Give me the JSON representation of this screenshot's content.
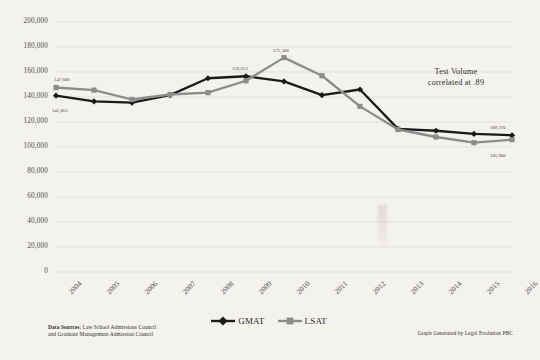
{
  "chart_data": {
    "type": "line",
    "title": "",
    "xlabel": "",
    "ylabel": "",
    "x": [
      "2004",
      "2005",
      "2006",
      "2007",
      "2008",
      "2009",
      "2010",
      "2011",
      "2012",
      "2013",
      "2014",
      "2015",
      "2016"
    ],
    "categories": [
      "2004",
      "2005",
      "2006",
      "2007",
      "2008",
      "2009",
      "2010",
      "2011",
      "2012",
      "2013",
      "2014",
      "2015",
      "2016"
    ],
    "ylim": [
      0,
      200000
    ],
    "xlim": [
      2004,
      2016
    ],
    "yticks": [
      "0",
      "20,000",
      "40,000",
      "60,000",
      "80,000",
      "100,000",
      "120,000",
      "140,000",
      "160,000",
      "180,000",
      "200,000"
    ],
    "ytick_values": [
      0,
      20000,
      40000,
      60000,
      80000,
      100000,
      120000,
      140000,
      160000,
      180000,
      200000
    ],
    "grid": true,
    "legend_position": "bottom-center",
    "series": [
      {
        "name": "GMAT",
        "color": "#1a1a1a",
        "marker": "diamond",
        "values": [
          141063,
          136500,
          135500,
          141500,
          155000,
          156613,
          152500,
          141500,
          146000,
          114500,
          113000,
          110500,
          109370
        ]
      },
      {
        "name": "LSAT",
        "color": "#8c8c8c",
        "marker": "square",
        "values": [
          147600,
          145500,
          138000,
          142000,
          143500,
          153000,
          171500,
          157000,
          132500,
          114000,
          108000,
          103500,
          105900
        ]
      }
    ],
    "point_labels": [
      {
        "series": "LSAT",
        "x": "2004",
        "text": "147,600",
        "dx": -2,
        "dy": -11
      },
      {
        "series": "GMAT",
        "x": "2004",
        "text": "141,063",
        "dx": -4,
        "dy": 12
      },
      {
        "series": "GMAT",
        "x": "2009",
        "text": "156,613",
        "dx": -14,
        "dy": -10
      },
      {
        "series": "LSAT",
        "x": "2010",
        "text": "171,500",
        "dx": -11,
        "dy": -10
      },
      {
        "series": "GMAT",
        "x": "2016",
        "text": "109,370",
        "dx": -22,
        "dy": -10
      },
      {
        "series": "LSAT",
        "x": "2016",
        "text": "105,900",
        "dx": -22,
        "dy": 13
      }
    ],
    "annotations": [
      {
        "name": "correlation-note",
        "line1": "Test Volume",
        "line2": "correlated at .89"
      }
    ]
  },
  "legend": {
    "items": [
      {
        "label": "GMAT",
        "color": "#1a1a1a",
        "marker": "diamond"
      },
      {
        "label": "LSAT",
        "color": "#8c8c8c",
        "marker": "square"
      }
    ]
  },
  "footer": {
    "sources_bold": "Data Sources",
    "sources_line1_rest": ": Law School Admissions Council",
    "sources_line2": "and Graduate Management Admission Council",
    "generated_by": "Graph Generated by Legal Evolution PBC"
  },
  "colors": {
    "background": "#f4f2ed",
    "gmat": "#1a1a1a",
    "lsat": "#8c8c8c",
    "grid": "#dcd9d2",
    "text": "#3a3a3a"
  }
}
